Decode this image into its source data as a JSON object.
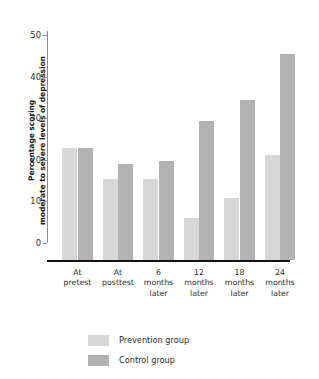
{
  "chart_data": {
    "type": "bar",
    "title": "",
    "xlabel": "",
    "ylabel": "Percentage scoring moderate to severe levels of depression",
    "ylabel_line1": "Percentage scoring",
    "ylabel_line2": "moderate to severe levels of depression",
    "ylim": [
      0,
      50
    ],
    "yticks": [
      0,
      10,
      20,
      30,
      40,
      50
    ],
    "ytick_labels": [
      "0",
      "10",
      "20",
      "30",
      "40",
      "50"
    ],
    "grid": false,
    "legend_position": "bottom-left",
    "categories": [
      "At pretest",
      "At posttest",
      "6 months later",
      "12 months later",
      "18 months later",
      "24 months later"
    ],
    "category_lines": [
      [
        "At",
        "pretest"
      ],
      [
        "At",
        "posttest"
      ],
      [
        "6",
        "months",
        "later"
      ],
      [
        "12",
        "months",
        "later"
      ],
      [
        "18",
        "months",
        "later"
      ],
      [
        "24",
        "months",
        "later"
      ]
    ],
    "series": [
      {
        "name": "Prevention group",
        "color": "#d7d7d7",
        "values": [
          23.0,
          15.5,
          15.5,
          6.2,
          11.0,
          21.3
        ]
      },
      {
        "name": "Control group",
        "color": "#b2b2b2",
        "values": [
          23.0,
          19.0,
          19.7,
          29.5,
          34.5,
          45.5
        ]
      }
    ]
  },
  "legend": {
    "items": [
      {
        "label": "Prevention group",
        "color": "#d7d7d7"
      },
      {
        "label": "Control group",
        "color": "#b2b2b2"
      }
    ]
  }
}
